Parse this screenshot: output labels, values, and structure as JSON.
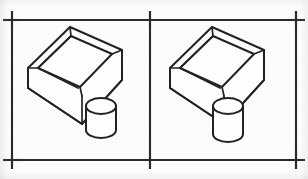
{
  "sheet": {
    "title": "Isometric line drawing comparison sheet",
    "width": 308,
    "height": 179,
    "background_color": "#fdfdfc",
    "ink_color": "#232323",
    "frame_color": "#2b2b2b"
  },
  "frame": {
    "name": "registration-frame",
    "top_y": 20,
    "bottom_y": 160,
    "left_x": 12,
    "right_x": 296,
    "divider_x": 150,
    "tick_overhang": 9
  },
  "registration_marks": [
    {
      "name": "top-left",
      "x": 12,
      "y": 20
    },
    {
      "name": "top-right",
      "x": 296,
      "y": 20
    },
    {
      "name": "bottom-left",
      "x": 12,
      "y": 160
    },
    {
      "name": "bottom-right",
      "x": 296,
      "y": 160
    },
    {
      "name": "divider-top",
      "x": 150,
      "y": 20
    },
    {
      "name": "divider-bottom",
      "x": 150,
      "y": 160
    }
  ],
  "panels": [
    {
      "name": "left-panel",
      "offset_x": 0,
      "figure": {
        "name": "open-box-with-cylinder",
        "description": "Open-top rectangular box shown in isometric projection with a short cylinder resting beside its front-right corner",
        "parts": [
          "open-top-box",
          "cylinder"
        ]
      }
    },
    {
      "name": "right-panel",
      "offset_x": 142,
      "figure": {
        "name": "open-box-with-cylinder",
        "description": "Open-top rectangular box shown in isometric projection with a short cylinder resting beside its front-right corner",
        "parts": [
          "open-top-box",
          "cylinder"
        ]
      }
    }
  ],
  "geometry": {
    "box": {
      "outer_top_rim": "28,68 70,27 122,50 82,96",
      "inner_top_rim": "38,68 71,36 112,54 80,87",
      "outer_left_wall": "28,68 28,88 82,124 82,96",
      "outer_front_wall": "82,96 82,124 122,80 122,50",
      "inner_back_left": "38,68 38,72",
      "floor_seam_a": "38,72 80,93",
      "floor_seam_b": "71,36 71,60"
    },
    "cylinder": {
      "center_x": 101,
      "top_y": 106,
      "bottom_y": 137,
      "rx": 15,
      "ry": 8
    }
  }
}
